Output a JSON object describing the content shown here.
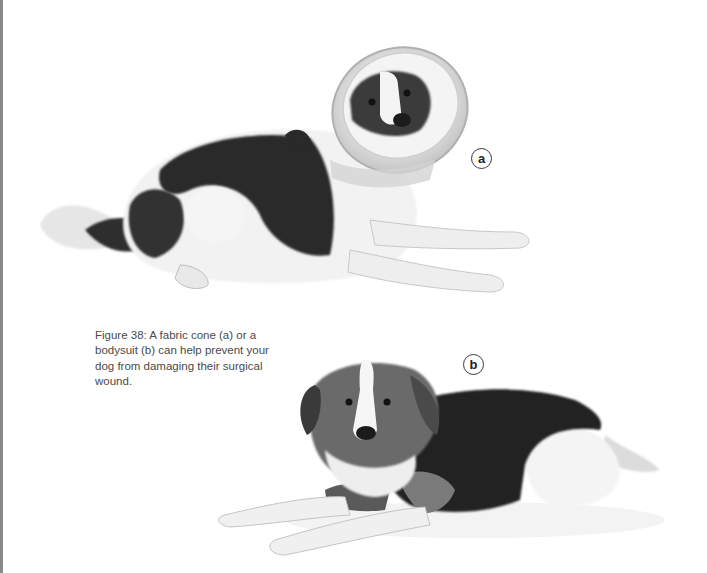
{
  "page": {
    "edge_color": "#8a8a8a",
    "background": "#ffffff"
  },
  "figure": {
    "number": "Figure 38",
    "caption": "Figure 38: A fabric cone (a) or a bodysuit (b) can help prevent your dog from damaging their surgical wound.",
    "photos": [
      {
        "id": "a",
        "label": "a",
        "description": "Black and white dog lying down wearing a fabric cone"
      },
      {
        "id": "b",
        "label": "b",
        "description": "Dog lying down wearing a dark bodysuit"
      }
    ]
  }
}
